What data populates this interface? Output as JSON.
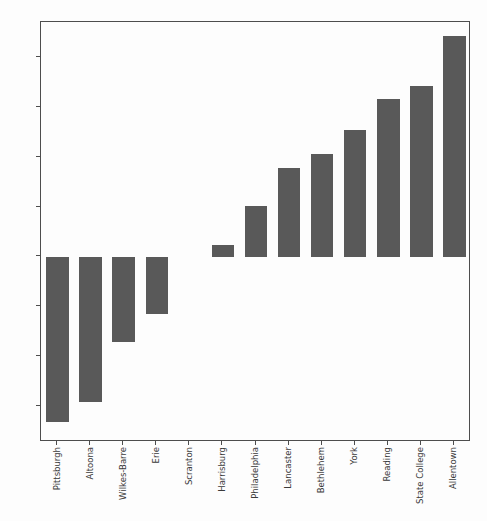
{
  "chart_data": {
    "type": "bar",
    "title": "",
    "subtitle": "",
    "xlabel": "",
    "ylabel": "",
    "categories": [
      "Pittsburgh",
      "Altoona",
      "Wilkes-Barre",
      "Erie",
      "Scranton",
      "Harrisburg",
      "Philadelphia",
      "Lancaster",
      "Bethlehem",
      "York",
      "Reading",
      "State College",
      "Allentown"
    ],
    "values": [
      -8.3,
      -7.3,
      -4.3,
      -2.85,
      0.0,
      0.6,
      2.55,
      4.45,
      5.15,
      6.35,
      7.95,
      8.6,
      11.1
    ],
    "ytick_labels": [
      "10.0",
      "7.5",
      "5.0",
      "2.5",
      "0.0",
      "−2.5",
      "−5.0",
      "−7.5"
    ],
    "ytick_values": [
      10.0,
      7.5,
      5.0,
      2.5,
      0.0,
      -2.5,
      -5.0,
      -7.5
    ],
    "ylim": [
      -9.3,
      11.8
    ],
    "grid": false,
    "legend": false,
    "legend_position": "none",
    "bar_color": "#595959",
    "axis_color": "#4d4d4d",
    "text_color": "#3a3a3a",
    "background_color": "#fdfdfd"
  }
}
